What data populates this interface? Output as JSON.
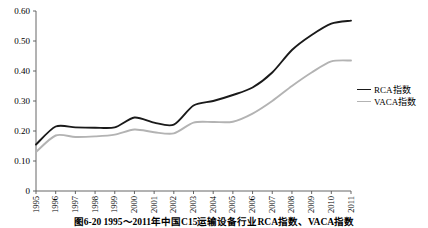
{
  "caption": "图6-20  1995～2011年中国C15运输设备行业RCA指数、VACA指数",
  "legend": {
    "position": "right-middle",
    "entries": [
      {
        "label": "RCA指数",
        "color": "#1a1a1a",
        "width": 1.8
      },
      {
        "label": "VACA指数",
        "color": "#b3b3b3",
        "width": 1.8
      }
    ]
  },
  "axes": {
    "y_ticks": [
      "0",
      "0.10",
      "0.20",
      "0.30",
      "0.40",
      "0.50",
      "0.60"
    ],
    "x_ticks": [
      "1995",
      "1996",
      "1997",
      "1998",
      "1999",
      "2000",
      "2001",
      "2002",
      "2003",
      "2004",
      "2005",
      "2006",
      "2007",
      "2008",
      "2009",
      "2010",
      "2011"
    ]
  },
  "chart_data": {
    "type": "line",
    "title": "图6-20  1995～2011年中国C15运输设备行业RCA指数、VACA指数",
    "xlabel": "",
    "ylabel": "",
    "ylim": [
      0,
      0.6
    ],
    "ytick_values": [
      0,
      0.1,
      0.2,
      0.3,
      0.4,
      0.5,
      0.6
    ],
    "grid": false,
    "legend_position": "right",
    "categories": [
      "1995",
      "1996",
      "1997",
      "1998",
      "1999",
      "2000",
      "2001",
      "2002",
      "2003",
      "2004",
      "2005",
      "2006",
      "2007",
      "2008",
      "2009",
      "2010",
      "2011"
    ],
    "series": [
      {
        "name": "RCA指数",
        "color": "#1a1a1a",
        "values": [
          0.155,
          0.215,
          0.212,
          0.211,
          0.212,
          0.245,
          0.228,
          0.221,
          0.285,
          0.3,
          0.32,
          0.345,
          0.395,
          0.47,
          0.52,
          0.558,
          0.568
        ]
      },
      {
        "name": "VACA指数",
        "color": "#b3b3b3",
        "values": [
          0.13,
          0.185,
          0.18,
          0.182,
          0.188,
          0.205,
          0.196,
          0.192,
          0.228,
          0.23,
          0.231,
          0.258,
          0.3,
          0.35,
          0.395,
          0.432,
          0.435
        ]
      }
    ]
  }
}
